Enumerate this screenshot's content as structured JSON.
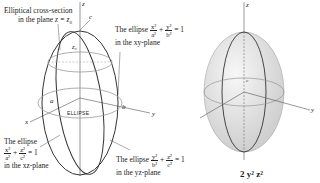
{
  "left_figure": {
    "axes": {
      "x": "x",
      "y": "y",
      "z": "z"
    },
    "semi_axes": {
      "a": "a",
      "b": "b",
      "c": "c"
    },
    "plane_label": "z₀",
    "band_labels": [
      "ELLIPSE",
      "ELLIPSE",
      "ELLIPSE"
    ],
    "annotations": {
      "cross_section": {
        "line1": "Elliptical cross-section",
        "line2_prefix": "in the plane ",
        "line2_math": "z = z₀"
      },
      "xy_ellipse": {
        "prefix": "The ellipse",
        "t1_num": "x²",
        "t1_den": "a²",
        "plus": "+",
        "t2_num": "y²",
        "t2_den": "b²",
        "eq": "= 1",
        "line2": "in the xy-plane"
      },
      "xz_ellipse": {
        "prefix": "The ellipse",
        "t1_num": "x²",
        "t1_den": "a²",
        "plus": "+",
        "t2_num": "z²",
        "t2_den": "c²",
        "eq": "= 1",
        "line2": "in the xz-plane"
      },
      "yz_ellipse": {
        "prefix": "The ellipse",
        "t1_num": "y²",
        "t1_den": "b²",
        "plus": "+",
        "t2_num": "z²",
        "t2_den": "c²",
        "eq": "= 1",
        "line2": "in the yz-plane"
      }
    }
  },
  "right_figure": {
    "axes": {
      "x": "x",
      "y": "y",
      "z": "z"
    },
    "semi_axes": {
      "a": "a",
      "b": "b",
      "c": "c"
    },
    "fill_color": "#e6e6e6",
    "bottom_partial_text": "2      y²      z²"
  },
  "colors": {
    "line": "#333333",
    "guide": "#8a8a8a",
    "surface": "#e8e8e8"
  }
}
